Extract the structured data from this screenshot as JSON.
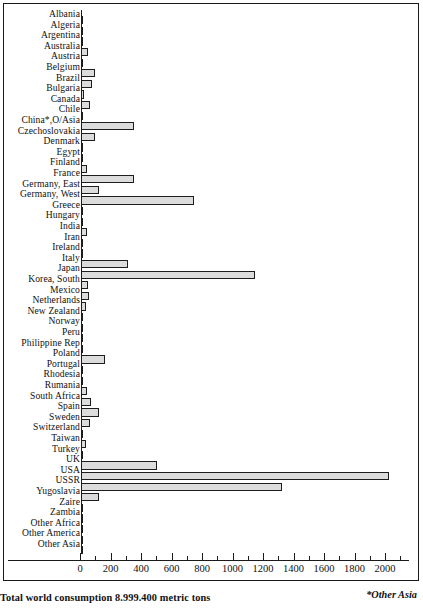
{
  "chart_data": {
    "type": "bar",
    "orientation": "horizontal",
    "title": "",
    "xlabel": "",
    "ylabel": "",
    "xlim": [
      0,
      2100
    ],
    "grid": false,
    "legend": null,
    "axis": {
      "tick_labels": [
        "0",
        "200",
        "400",
        "600",
        "800",
        "1000",
        "1200",
        "1400",
        "1600",
        "1800",
        "2000"
      ],
      "tick_values": [
        0,
        200,
        400,
        600,
        800,
        1000,
        1200,
        1400,
        1600,
        1800,
        2000
      ],
      "minor_tick_step": 100,
      "major_tick_step": 200
    },
    "categories": [
      "Albania",
      "Algeria",
      "Argentina",
      "Australia",
      "Austria",
      "Belgium",
      "Brazil",
      "Bulgaria",
      "Canada",
      "Chile",
      "China*,O/Asia",
      "Czechoslovakia",
      "Denmark",
      "Egypt",
      "Finland",
      "France",
      "Germany, East",
      "Germany, West",
      "Greece",
      "Hungary",
      "India",
      "Iran",
      "Ireland",
      "Italy",
      "Japan",
      "Korea, South",
      "Mexico",
      "Netherlands",
      "New Zealand",
      "Norway",
      "Peru",
      "Philippine Rep",
      "Poland",
      "Portugal",
      "Rhodesia",
      "Rumania",
      "South Africa",
      "Spain",
      "Sweden",
      "Switzerland",
      "Taiwan",
      "Turkey",
      "UK",
      "USA",
      "USSR",
      "Yugoslavia",
      "Zaire",
      "Zambia",
      "Other Africa",
      "Other America",
      "Other Asia"
    ],
    "values": [
      8,
      4,
      7,
      45,
      6,
      95,
      72,
      22,
      62,
      4,
      350,
      92,
      5,
      10,
      38,
      350,
      118,
      740,
      8,
      14,
      40,
      5,
      4,
      310,
      1140,
      48,
      55,
      30,
      3,
      12,
      4,
      4,
      160,
      3,
      5,
      42,
      65,
      118,
      62,
      16,
      30,
      13,
      500,
      2020,
      1320,
      115,
      8,
      8,
      5,
      11,
      3
    ],
    "value_unit": "thousand metric tons"
  },
  "caption": {
    "total": "Total world consumption 8.999.400 metric tons",
    "footnote": "*Other Asia"
  }
}
